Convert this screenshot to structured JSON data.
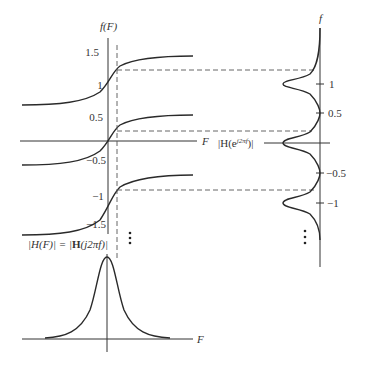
{
  "figure": {
    "left_plot": {
      "y_axis_label": "f(F)",
      "x_axis_label": "F",
      "y_ticks": [
        "1.5",
        "1",
        "0.5",
        "−0.5",
        "−1",
        "−1.5"
      ],
      "continuation": "⋮"
    },
    "right_plot": {
      "y_axis_label": "f",
      "x_axis_label": "|H(e^{j2πf})|",
      "label_main": "|H(e",
      "label_sup": "j2πf",
      "label_end": ")|",
      "y_ticks": [
        "1",
        "0.5",
        "−0.5",
        "−1"
      ],
      "continuation": "⋮"
    },
    "bottom_plot": {
      "label": "|H(F)| = |H(j2πf)|",
      "label_part1": "|H(F)| = |",
      "label_bold": "H",
      "label_part2": "(j2πf)|",
      "x_axis_label": "F"
    },
    "colors": {
      "line": "#2a2a2a",
      "dash": "#555555",
      "background": "#ffffff"
    }
  }
}
